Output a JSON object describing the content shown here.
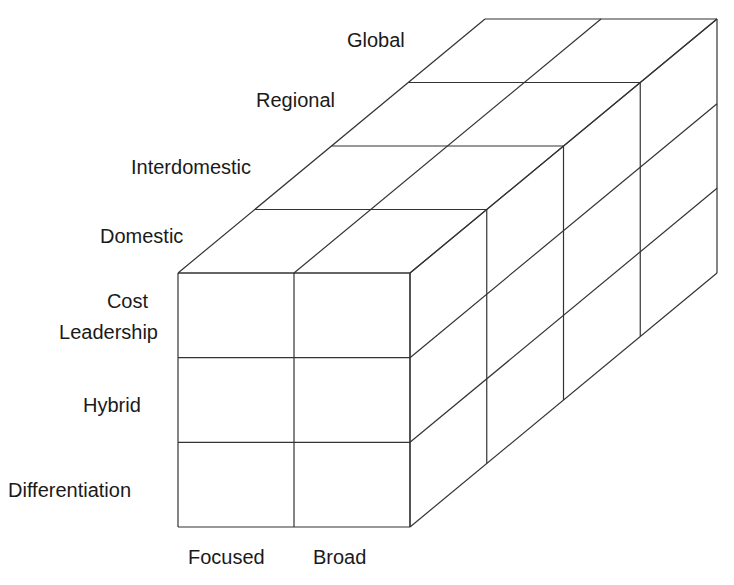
{
  "diagram": {
    "type": "3d-cube-matrix",
    "line_color": "#333333",
    "background": "#ffffff",
    "axes": {
      "depth": {
        "description": "Geographic scope (front to back)",
        "labels": [
          "Domestic",
          "Interdomestic",
          "Regional",
          "Global"
        ]
      },
      "vertical": {
        "description": "Generic strategy (top to bottom)",
        "labels": [
          {
            "line1": "Cost",
            "line2": "Leadership"
          },
          {
            "line1": "Hybrid"
          },
          {
            "line1": "Differentiation"
          }
        ]
      },
      "horizontal": {
        "description": "Competitive scope (left to right)",
        "labels": [
          "Focused",
          "Broad"
        ]
      }
    },
    "grid": {
      "columns": 2,
      "rows": 3,
      "layers": 4
    }
  }
}
